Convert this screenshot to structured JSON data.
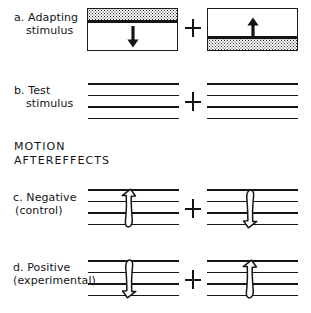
{
  "figure": {
    "background_color": "#ffffff",
    "ink_color": "#141414",
    "rows": [
      {
        "id": "a",
        "label_line1": "a. Adapting",
        "label_line2": "stimulus",
        "separator": "+",
        "left_panel": {
          "name": "adapting-stimulus-left",
          "stipple_band_position": "top",
          "arrow_direction": "down",
          "arrow_style": "solid-straight"
        },
        "right_panel": {
          "name": "adapting-stimulus-right",
          "stipple_band_position": "bottom",
          "arrow_direction": "up",
          "arrow_style": "solid-straight"
        }
      },
      {
        "id": "b",
        "label_line1": "b. Test",
        "label_line2": "stimulus",
        "separator": "+",
        "left_panel": {
          "name": "test-stimulus-left",
          "line_count": 4,
          "arrow_direction": "none"
        },
        "right_panel": {
          "name": "test-stimulus-right",
          "line_count": 4,
          "arrow_direction": "none"
        }
      },
      {
        "id": "c",
        "label_line1": "c. Negative",
        "label_line2": "(control)",
        "separator": "+",
        "left_panel": {
          "name": "negative-aftereffect-left",
          "line_count": 4,
          "arrow_direction": "up",
          "arrow_style": "curved-outline"
        },
        "right_panel": {
          "name": "negative-aftereffect-right",
          "line_count": 4,
          "arrow_direction": "down",
          "arrow_style": "curved-outline"
        }
      },
      {
        "id": "d",
        "label_line1": "d. Positive",
        "label_line2": "(experimental)",
        "separator": "+",
        "left_panel": {
          "name": "positive-aftereffect-left",
          "line_count": 4,
          "arrow_direction": "down",
          "arrow_style": "curved-outline"
        },
        "right_panel": {
          "name": "positive-aftereffect-right",
          "line_count": 4,
          "arrow_direction": "up",
          "arrow_style": "curved-outline"
        }
      }
    ],
    "section_heading": {
      "line1": "MOTION",
      "line2": "AFTEREFFECTS"
    }
  }
}
